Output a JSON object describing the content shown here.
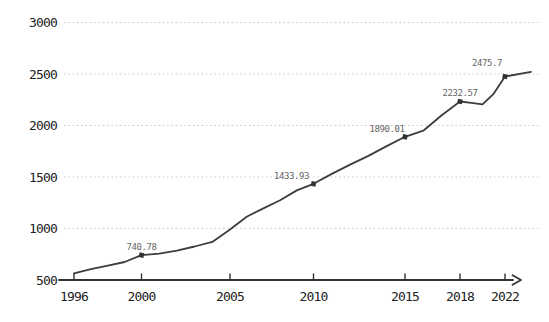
{
  "figure": {
    "title": "",
    "background": "#ffffff"
  },
  "chart_data": {
    "type": "line",
    "title": "",
    "xlabel": "",
    "ylabel": "",
    "legend": "none",
    "grid": "horizontal-dotted",
    "style": "xkcd-sketch",
    "ylim": [
      500,
      3000
    ],
    "y_ticks": [
      500,
      1000,
      1500,
      2000,
      2500,
      3000
    ],
    "x_ticks": [
      1996,
      2000,
      2005,
      2010,
      2015,
      2018,
      2022
    ],
    "series": [
      {
        "name": "value",
        "x": [
          1996,
          1997,
          1998,
          1999,
          2000,
          2001,
          2002,
          2003,
          2004,
          2005,
          2006,
          2007,
          2008,
          2009,
          2010,
          2011,
          2012,
          2013,
          2014,
          2015,
          2016,
          2017,
          2018,
          2019,
          2020,
          2021,
          2022,
          2023
        ],
        "values": [
          565,
          605,
          640,
          675,
          740.78,
          755,
          785,
          825,
          870,
          990,
          1115,
          1195,
          1275,
          1370,
          1433.93,
          1530,
          1620,
          1705,
          1800,
          1890.01,
          1950,
          2100,
          2232.57,
          2220,
          2205,
          2310,
          2475.7,
          2520
        ]
      }
    ],
    "labeled_points": [
      {
        "year": 2000,
        "value": 740.78,
        "label": "740.78",
        "dx": 0,
        "dy": -8
      },
      {
        "year": 2010,
        "value": 1433.93,
        "label": "1433.93",
        "dx": -22,
        "dy": -8
      },
      {
        "year": 2015,
        "value": 1890.01,
        "label": "1890.01",
        "dx": -18,
        "dy": -8
      },
      {
        "year": 2018,
        "value": 2232.57,
        "label": "2232.57",
        "dx": 0,
        "dy": -9
      },
      {
        "year": 2022,
        "value": 2475.7,
        "label": "2475.7",
        "dx": -18,
        "dy": -14
      }
    ],
    "colors": {
      "line": "#3d3d3d",
      "marker": "#333333",
      "grid": "#c9c9c9",
      "axis": "#333333",
      "tick_label": "#222222",
      "annotation": "#666666",
      "background": "#ffffff"
    },
    "layout_hints": {
      "width": 549,
      "height": 322,
      "axis_y_px": 280,
      "px_per_unit_y": 0.103,
      "grid_left_px": 64,
      "grid_right_px": 541,
      "axis_start_x_px": 59,
      "axis_end_x_px": 513,
      "arrow_tip_x_px": 521,
      "ytick_label_right_px": 57,
      "xtick_label_baseline_px": 301,
      "x_anchor_px": [
        [
          1996,
          74
        ],
        [
          2000,
          141.5
        ],
        [
          2005,
          230
        ],
        [
          2010,
          313.5
        ],
        [
          2015,
          405
        ],
        [
          2018,
          460
        ],
        [
          2022,
          505
        ],
        [
          2023,
          531
        ]
      ]
    }
  }
}
